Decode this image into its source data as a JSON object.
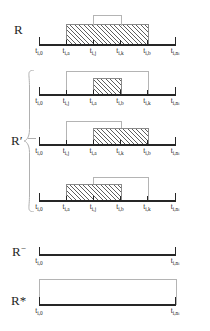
{
  "figure": {
    "axis_color": "#262626",
    "hatch_color": "#5e5e5e",
    "outline_color": "#b4b4b4",
    "brace_color": "#b0b0b0"
  },
  "rows": [
    {
      "id": "R",
      "label": "R",
      "label_x": 14,
      "label_y": 22,
      "axis_y": 44,
      "axis_x0": 39,
      "axis_x1": 175,
      "ticks": [
        {
          "label_main": "t",
          "label_sub": "i,0",
          "x": 39
        },
        {
          "label_main": "t",
          "label_sub": "i,a",
          "x": 66
        },
        {
          "label_main": "t",
          "label_sub": "i,j",
          "x": 93
        },
        {
          "label_main": "t",
          "label_sub": "i,k",
          "x": 120
        },
        {
          "label_main": "t",
          "label_sub": "i,b",
          "x": 147
        },
        {
          "label_main": "t",
          "label_sub": "i,n",
          "label_sub2": "i",
          "x": 175
        }
      ],
      "boxes": [
        {
          "kind": "hatch",
          "from": 1,
          "to": 4,
          "top": 24,
          "height": 19
        },
        {
          "kind": "open",
          "from": 2,
          "to": 3,
          "top": 15,
          "height": 10
        }
      ]
    },
    {
      "id": "Rprime-1",
      "label": "",
      "label_x": 0,
      "label_y": 0,
      "axis_y": 94,
      "axis_x0": 39,
      "axis_x1": 175,
      "ticks": [
        {
          "label_main": "t",
          "label_sub": "i,0",
          "x": 39
        },
        {
          "label_main": "t",
          "label_sub": "i,j",
          "x": 66
        },
        {
          "label_main": "t",
          "label_sub": "i,a",
          "x": 93
        },
        {
          "label_main": "t",
          "label_sub": "i,b",
          "x": 120
        },
        {
          "label_main": "t",
          "label_sub": "i,k",
          "x": 147
        },
        {
          "label_main": "t",
          "label_sub": "i,n",
          "label_sub2": "i",
          "x": 175
        }
      ],
      "boxes": [
        {
          "kind": "open",
          "from": 1,
          "to": 4,
          "top": 71,
          "height": 22
        },
        {
          "kind": "hatch",
          "from": 2,
          "to": 3,
          "top": 78,
          "height": 15
        }
      ]
    },
    {
      "id": "Rprime-2",
      "label": "R′",
      "label_x": 11,
      "label_y": 133,
      "axis_y": 144,
      "axis_x0": 39,
      "axis_x1": 175,
      "ticks": [
        {
          "label_main": "t",
          "label_sub": "i,0",
          "x": 39
        },
        {
          "label_main": "t",
          "label_sub": "i,j",
          "x": 66
        },
        {
          "label_main": "t",
          "label_sub": "i,a",
          "x": 93
        },
        {
          "label_main": "t",
          "label_sub": "i,k",
          "x": 120
        },
        {
          "label_main": "t",
          "label_sub": "i,b",
          "x": 147
        },
        {
          "label_main": "t",
          "label_sub": "i,n",
          "label_sub2": "i",
          "x": 175
        }
      ],
      "boxes": [
        {
          "kind": "open",
          "from": 1,
          "to": 3,
          "top": 121,
          "height": 22
        },
        {
          "kind": "hatch",
          "from": 2,
          "to": 4,
          "top": 128,
          "height": 15
        }
      ]
    },
    {
      "id": "Rprime-3",
      "label": "",
      "label_x": 0,
      "label_y": 0,
      "axis_y": 200,
      "axis_x0": 39,
      "axis_x1": 175,
      "ticks": [
        {
          "label_main": "t",
          "label_sub": "i,0",
          "x": 39
        },
        {
          "label_main": "t",
          "label_sub": "i,a",
          "x": 66
        },
        {
          "label_main": "t",
          "label_sub": "i,j",
          "x": 93
        },
        {
          "label_main": "t",
          "label_sub": "i,b",
          "x": 120
        },
        {
          "label_main": "t",
          "label_sub": "i,k",
          "x": 147
        },
        {
          "label_main": "t",
          "label_sub": "i,n",
          "label_sub2": "i",
          "x": 175
        }
      ],
      "boxes": [
        {
          "kind": "open",
          "from": 2,
          "to": 4,
          "top": 177,
          "height": 22
        },
        {
          "kind": "hatch",
          "from": 1,
          "to": 3,
          "top": 184,
          "height": 15
        }
      ]
    },
    {
      "id": "Rminus",
      "label": "R",
      "label_sup": "−",
      "label_x": 12,
      "label_y": 243,
      "axis_y": 254,
      "axis_x0": 39,
      "axis_x1": 175,
      "ticks": [
        {
          "label_main": "t",
          "label_sub": "i,0",
          "x": 39
        },
        {
          "label_main": "t",
          "label_sub": "i,n",
          "label_sub2": "i",
          "x": 175
        }
      ],
      "boxes": []
    },
    {
      "id": "Rstar",
      "label": "R*",
      "label_x": 11,
      "label_y": 293,
      "axis_y": 304,
      "axis_x0": 39,
      "axis_x1": 175,
      "ticks": [
        {
          "label_main": "t",
          "label_sub": "i,0",
          "x": 39
        },
        {
          "label_main": "t",
          "label_sub": "i,n",
          "label_sub2": "i",
          "x": 175
        }
      ],
      "boxes": [
        {
          "kind": "open",
          "from": 0,
          "to": 1,
          "top": 279,
          "height": 25
        }
      ]
    }
  ],
  "brace": {
    "x": 24,
    "y": 70,
    "width": 10,
    "height": 142,
    "stem_y": 138,
    "stem_x": 28,
    "stem_w": 8
  }
}
